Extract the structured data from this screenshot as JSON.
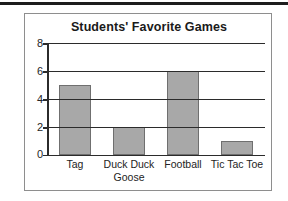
{
  "chart_data": {
    "type": "bar",
    "title": "Students' Favorite Games",
    "xlabel": "",
    "ylabel": "",
    "categories": [
      "Tag",
      "Duck Duck Goose",
      "Football",
      "Tic Tac Toe"
    ],
    "category_lines": [
      [
        "Tag"
      ],
      [
        "Duck Duck",
        "Goose"
      ],
      [
        "Football"
      ],
      [
        "Tic Tac Toe"
      ]
    ],
    "values": [
      5,
      2,
      6,
      1
    ],
    "ylim": [
      0,
      8
    ],
    "ytick_values": [
      0,
      2,
      4,
      6,
      8
    ],
    "ytick_labels": [
      "0",
      "2",
      "4",
      "6",
      "8"
    ],
    "grid": "horizontal",
    "legend": "none",
    "bar_color": "#a8a8a8",
    "bar_border_color": "#6f6f6f",
    "axis_color": "#2b2b2b",
    "panel_border_color": "#8e8e8e",
    "background_color": "#ffffff"
  }
}
